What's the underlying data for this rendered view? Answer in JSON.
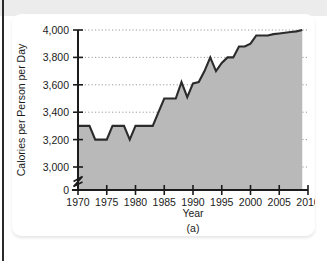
{
  "figure": {
    "caption": "(a)",
    "panel_label": "(a)"
  },
  "colors": {
    "area_fill": "#b9b9b9",
    "line": "#2b2b2b",
    "axis": "#1b1b1b",
    "gridline": "#9a9a9a",
    "card_background": "#ffffff",
    "top_band": "#ececec",
    "left_rule": "#2a2a2a"
  },
  "chart_data": {
    "type": "area",
    "title": "",
    "subtitle": "",
    "xlabel": "Year",
    "ylabel": "Calories per Person per Day",
    "xlim": [
      1970,
      2010
    ],
    "ylim": [
      3000,
      4000
    ],
    "y_axis_break": true,
    "y_baseline_label": "0",
    "grid": true,
    "grid_style": "dotted-horizontal",
    "legend": "none",
    "x_ticks": [
      1970,
      1975,
      1980,
      1985,
      1990,
      1995,
      2000,
      2005,
      2010
    ],
    "x_tick_labels": [
      "1970",
      "1975",
      "1980",
      "1985",
      "1990",
      "1995",
      "2000",
      "2005",
      "2010"
    ],
    "y_ticks": [
      0,
      3000,
      3200,
      3400,
      3600,
      3800,
      4000
    ],
    "y_tick_labels": [
      "0",
      "3,000",
      "3,200",
      "3,400",
      "3,600",
      "3,800",
      "4,000"
    ],
    "x": [
      1970,
      1971,
      1972,
      1973,
      1974,
      1975,
      1976,
      1977,
      1978,
      1979,
      1980,
      1981,
      1982,
      1983,
      1984,
      1985,
      1986,
      1987,
      1988,
      1989,
      1990,
      1991,
      1992,
      1993,
      1994,
      1995,
      1996,
      1997,
      1998,
      1999,
      2000,
      2001,
      2002,
      2003,
      2004,
      2005,
      2006,
      2007,
      2008,
      2009
    ],
    "values": [
      3300,
      3300,
      3300,
      3200,
      3200,
      3200,
      3300,
      3300,
      3300,
      3200,
      3300,
      3300,
      3300,
      3300,
      3400,
      3500,
      3500,
      3500,
      3620,
      3510,
      3610,
      3620,
      3700,
      3800,
      3700,
      3760,
      3800,
      3800,
      3880,
      3880,
      3900,
      3960,
      3960,
      3960,
      3970,
      3975,
      3980,
      3985,
      3990,
      4000
    ],
    "series": [
      {
        "name": "Calories per Person per Day",
        "values": [
          3300,
          3300,
          3300,
          3200,
          3200,
          3200,
          3300,
          3300,
          3300,
          3200,
          3300,
          3300,
          3300,
          3300,
          3400,
          3500,
          3500,
          3500,
          3620,
          3510,
          3610,
          3620,
          3700,
          3800,
          3700,
          3760,
          3800,
          3800,
          3880,
          3880,
          3900,
          3960,
          3960,
          3960,
          3970,
          3975,
          3980,
          3985,
          3990,
          4000
        ]
      }
    ]
  }
}
